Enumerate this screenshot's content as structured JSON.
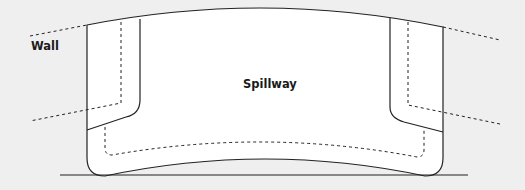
{
  "diagram": {
    "labels": {
      "wall": "Wall",
      "spillway": "Spillway"
    },
    "colors": {
      "background": "#efefef",
      "fill": "#ffffff",
      "stroke": "#222222"
    }
  }
}
